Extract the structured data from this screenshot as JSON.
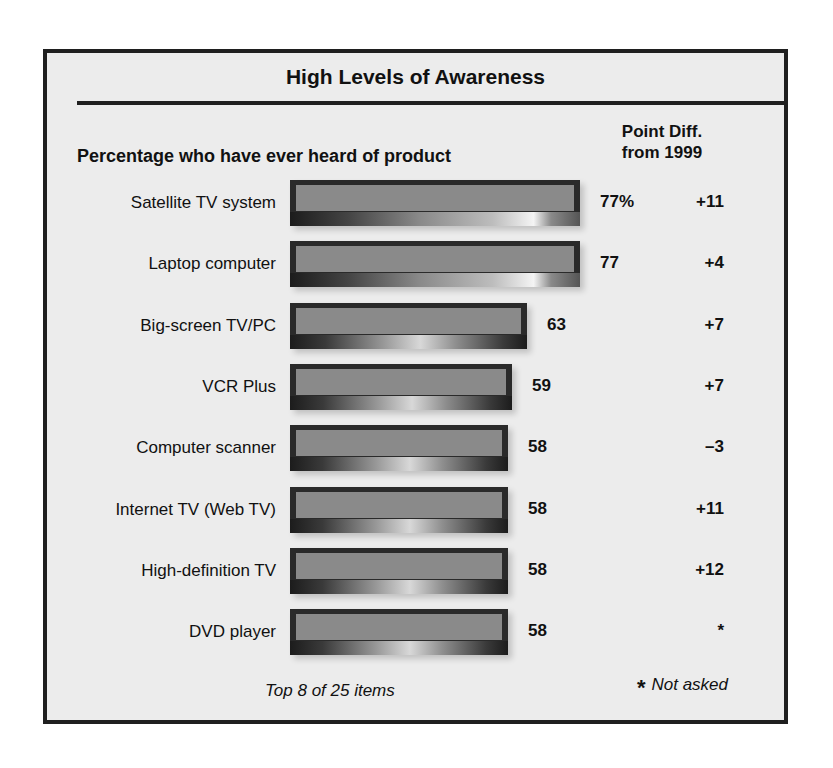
{
  "title": "High Levels of Awareness",
  "subtitle": "Percentage who have ever heard of product",
  "diff_header_line1": "Point Diff.",
  "diff_header_line2": "from 1999",
  "rows": [
    {
      "label": "Satellite TV system",
      "value": 77,
      "display": "77%",
      "diff": "+11"
    },
    {
      "label": "Laptop computer",
      "value": 77,
      "display": "77",
      "diff": "+4"
    },
    {
      "label": "Big-screen TV/PC",
      "value": 63,
      "display": "63",
      "diff": "+7"
    },
    {
      "label": "VCR Plus",
      "value": 59,
      "display": "59",
      "diff": "+7"
    },
    {
      "label": "Computer scanner",
      "value": 58,
      "display": "58",
      "diff": "–3"
    },
    {
      "label": "Internet TV (Web TV)",
      "value": 58,
      "display": "58",
      "diff": "+11"
    },
    {
      "label": "High-definition TV",
      "value": 58,
      "display": "58",
      "diff": "+12"
    },
    {
      "label": "DVD player",
      "value": 58,
      "display": "58",
      "diff": "*"
    }
  ],
  "footnote_left": "Top 8 of 25 items",
  "footnote_star": "*",
  "footnote_right": "Not asked",
  "colors": {
    "frame": "#1f1f1f",
    "panel_bg": "#ececec",
    "bar_border": "#2a2a2a",
    "bar_fill": "#8a8a8a"
  },
  "chart_data": {
    "type": "bar",
    "orientation": "horizontal",
    "title": "High Levels of Awareness",
    "subtitle": "Percentage who have ever heard of product",
    "categories": [
      "Satellite TV system",
      "Laptop computer",
      "Big-screen TV/PC",
      "VCR Plus",
      "Computer scanner",
      "Internet TV (Web TV)",
      "High-definition TV",
      "DVD player"
    ],
    "values": [
      77,
      77,
      63,
      59,
      58,
      58,
      58,
      58
    ],
    "unit": "%",
    "secondary_column": {
      "header": "Point Diff. from 1999",
      "values": [
        "+11",
        "+4",
        "+7",
        "+7",
        "-3",
        "+11",
        "+12",
        "*"
      ]
    },
    "notes": [
      "Top 8 of 25 items",
      "* Not asked"
    ],
    "xlabel": "",
    "ylabel": "",
    "grid": false,
    "legend": null
  }
}
